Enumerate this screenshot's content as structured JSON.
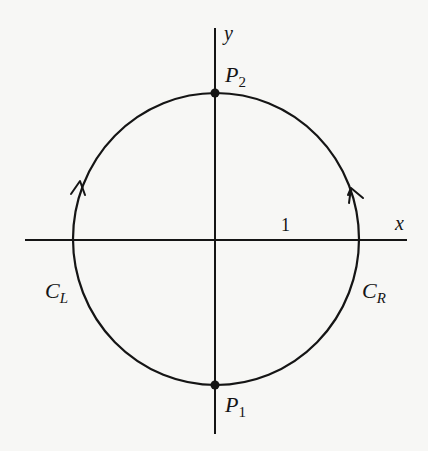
{
  "figure": {
    "type": "contour-diagram",
    "axes": {
      "x_label": "x",
      "y_label": "y",
      "tick_label": "1"
    },
    "contour": {
      "shape": "circle",
      "direction": "counterclockwise",
      "left_arc_label": {
        "main": "C",
        "sub": "L"
      },
      "right_arc_label": {
        "main": "C",
        "sub": "R"
      }
    },
    "points": [
      {
        "id": "P1",
        "main": "P",
        "sub": "1",
        "position": "bottom of circle on y-axis"
      },
      {
        "id": "P2",
        "main": "P",
        "sub": "2",
        "position": "top of circle on y-axis"
      }
    ],
    "colors": {
      "ink": "#151515",
      "background": "#f7f7f5"
    }
  }
}
